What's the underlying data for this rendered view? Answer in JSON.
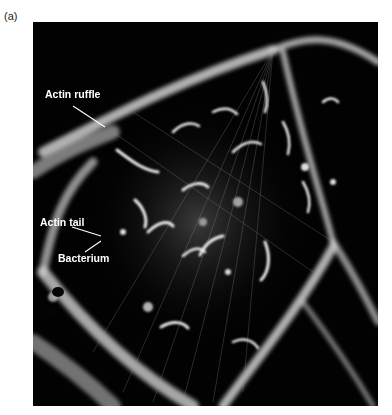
{
  "figure": {
    "panel_label": "(a)",
    "image_description": "Fluorescence micrograph of a cell infected with bacteria, showing actin structures",
    "labels": [
      {
        "text": "Actin ruffle"
      },
      {
        "text": "Actin tail"
      },
      {
        "text": "Bacterium"
      }
    ],
    "colors": {
      "background": "#020202",
      "fluorescence": "#e8e8e8",
      "label_text": "#ffffff"
    }
  }
}
